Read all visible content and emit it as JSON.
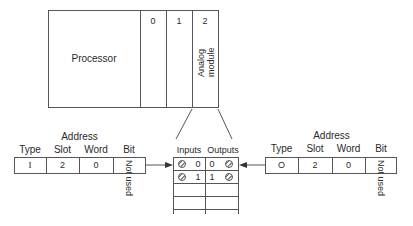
{
  "rack": {
    "processor_label": "Processor",
    "slots": [
      {
        "number": "0",
        "module": ""
      },
      {
        "number": "1",
        "module": ""
      },
      {
        "number": "2",
        "module_line1": "Analog",
        "module_line2": "module"
      }
    ]
  },
  "terminal_block": {
    "inputs_label": "Inputs",
    "outputs_label": "Outputs",
    "rows": [
      {
        "input_terminal": "0",
        "output_terminal": "0"
      },
      {
        "input_terminal": "1",
        "output_terminal": "1"
      },
      {
        "input_terminal": "",
        "output_terminal": ""
      },
      {
        "input_terminal": "",
        "output_terminal": ""
      }
    ]
  },
  "input_address": {
    "title": "Address",
    "headers": [
      "Type",
      "Slot",
      "Word",
      "Bit"
    ],
    "values": [
      "I",
      "2",
      "0"
    ],
    "bit_note": "Not used"
  },
  "output_address": {
    "title": "Address",
    "headers": [
      "Type",
      "Slot",
      "Word",
      "Bit"
    ],
    "values": [
      "O",
      "2",
      "0"
    ],
    "bit_note": "Not used"
  }
}
